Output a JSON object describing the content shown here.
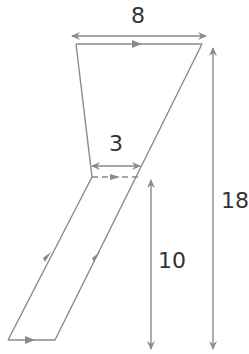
{
  "diagram": {
    "labels": {
      "top_width": "8",
      "inner_width": "3",
      "lower_height": "10",
      "total_height": "18"
    },
    "colors": {
      "line": "#8a8a8a",
      "text": "#333333"
    }
  }
}
